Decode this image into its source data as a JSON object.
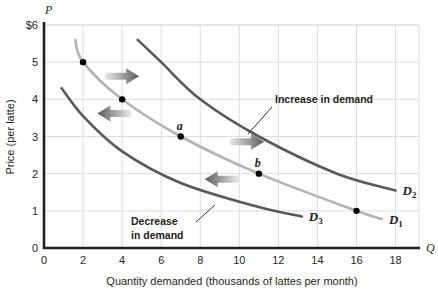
{
  "chart_data": {
    "type": "line",
    "title": "",
    "xlabel": "Quantity demanded (thousands of lattes per month)",
    "ylabel": "Price (per latte)",
    "x_axis_letter": "Q",
    "y_axis_letter": "P",
    "xlim": [
      0,
      19.2
    ],
    "ylim": [
      0,
      6
    ],
    "grid": true,
    "legend_position": "inline-curve-labels",
    "xticks": [
      "0",
      "2",
      "4",
      "6",
      "8",
      "10",
      "12",
      "14",
      "16",
      "18"
    ],
    "xtick_values": [
      0,
      2,
      4,
      6,
      8,
      10,
      12,
      14,
      16,
      18
    ],
    "yticks": [
      "0",
      "1",
      "2",
      "3",
      "4",
      "5",
      "$6"
    ],
    "ytick_values": [
      0,
      1,
      2,
      3,
      4,
      5,
      6
    ],
    "series": [
      {
        "name": "D1",
        "label": "D",
        "label_sub": "1",
        "color": "#b3b3b3",
        "points": [
          {
            "x": 1.6,
            "y": 5.6
          },
          {
            "x": 2.0,
            "y": 5.0
          },
          {
            "x": 4.0,
            "y": 4.0
          },
          {
            "x": 7.0,
            "y": 3.0
          },
          {
            "x": 11.0,
            "y": 2.0
          },
          {
            "x": 16.0,
            "y": 1.0
          },
          {
            "x": 17.3,
            "y": 0.78
          }
        ],
        "markers": [
          {
            "x": 2.0,
            "y": 5.0,
            "label": ""
          },
          {
            "x": 4.0,
            "y": 4.0,
            "label": ""
          },
          {
            "x": 7.0,
            "y": 3.0,
            "label": "a"
          },
          {
            "x": 11.0,
            "y": 2.0,
            "label": "b"
          },
          {
            "x": 16.0,
            "y": 1.0,
            "label": ""
          }
        ]
      },
      {
        "name": "D2",
        "label": "D",
        "label_sub": "2",
        "color": "#58595b",
        "points": [
          {
            "x": 4.8,
            "y": 5.6
          },
          {
            "x": 6.0,
            "y": 5.0
          },
          {
            "x": 8.0,
            "y": 4.0
          },
          {
            "x": 11.0,
            "y": 3.0
          },
          {
            "x": 15.0,
            "y": 2.0
          },
          {
            "x": 18.0,
            "y": 1.55
          }
        ],
        "markers": []
      },
      {
        "name": "D3",
        "label": "D",
        "label_sub": "3",
        "color": "#58595b",
        "points": [
          {
            "x": 0.9,
            "y": 4.3
          },
          {
            "x": 2.0,
            "y": 3.55
          },
          {
            "x": 4.0,
            "y": 2.6
          },
          {
            "x": 7.0,
            "y": 1.75
          },
          {
            "x": 11.0,
            "y": 1.1
          },
          {
            "x": 13.2,
            "y": 0.85
          }
        ],
        "markers": []
      }
    ],
    "annotations": [
      {
        "name": "increase-in-demand",
        "text_line1": "Increase in demand",
        "text_line2": "",
        "x": 10.7,
        "y": 3.55
      },
      {
        "name": "decrease-in-demand",
        "text_line1": "Decrease",
        "text_line2": "in demand",
        "x": 3.2,
        "y": 1.25
      }
    ],
    "shift_arrows": [
      {
        "name": "increase-arrow-upper",
        "direction": "right",
        "x": 4.0,
        "y": 4.62
      },
      {
        "name": "decrease-arrow-upper",
        "direction": "left",
        "x": 3.6,
        "y": 3.62
      },
      {
        "name": "increase-arrow-lower",
        "direction": "right",
        "x": 10.4,
        "y": 2.86
      },
      {
        "name": "decrease-arrow-lower",
        "direction": "left",
        "x": 9.1,
        "y": 1.85
      }
    ]
  },
  "colors": {
    "axis": "#231f20",
    "grid": "#d9dde3",
    "d1": "#b3b3b3",
    "d2": "#58595b",
    "d3": "#58595b",
    "marker": "#000000",
    "arrow_dark": "#6d6e71",
    "arrow_light": "#e6e7e8",
    "background": "#ffffff"
  }
}
